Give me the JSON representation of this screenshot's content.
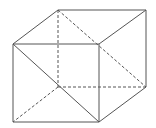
{
  "diagram": {
    "type": "cube-wireframe",
    "stroke_color": "#555555",
    "background": "#ffffff",
    "vertices": {
      "BTL": [
        58,
        10
      ],
      "BTR": [
        146,
        10
      ],
      "FTL": [
        13,
        44
      ],
      "FTR": [
        99,
        44
      ],
      "FBL": [
        13,
        122
      ],
      "FBR": [
        99,
        122
      ],
      "BBL": [
        58,
        87
      ],
      "BBR": [
        146,
        87
      ]
    },
    "solid_edges": [
      [
        "FTL",
        "FTR"
      ],
      [
        "FTR",
        "FBR"
      ],
      [
        "FBR",
        "FBL"
      ],
      [
        "FBL",
        "FTL"
      ],
      [
        "FTL",
        "BTL"
      ],
      [
        "BTL",
        "BTR"
      ],
      [
        "BTR",
        "FTR"
      ],
      [
        "BTR",
        "BBR"
      ],
      [
        "BBR",
        "FBR"
      ],
      [
        "FTL",
        "FBR"
      ]
    ],
    "dashed_edges": [
      [
        "BTL",
        "BBL"
      ],
      [
        "BBL",
        "BBR"
      ],
      [
        "BBL",
        "FBL"
      ],
      [
        "BTL",
        "BBR"
      ]
    ]
  }
}
